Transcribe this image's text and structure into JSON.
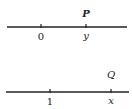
{
  "diagram": {
    "lines": [
      {
        "name": "number-line-1",
        "ticks": [
          {
            "label": "0",
            "x": 41,
            "italic": false
          },
          {
            "label": "y",
            "x": 86,
            "italic": true
          }
        ],
        "point": {
          "label": "P",
          "x": 86
        }
      },
      {
        "name": "number-line-2",
        "ticks": [
          {
            "label": "1",
            "x": 50,
            "italic": false
          },
          {
            "label": "x",
            "x": 111,
            "italic": true
          }
        ],
        "point": {
          "label": "Q",
          "x": 111
        }
      }
    ],
    "line_color": "#222222"
  }
}
